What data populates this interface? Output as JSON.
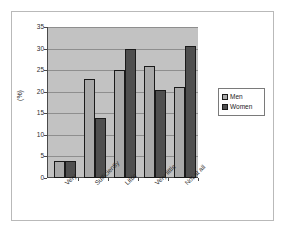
{
  "chart_data": {
    "type": "bar",
    "title": "",
    "subtitle": "",
    "xlabel": "",
    "ylabel": "(%)",
    "categories": [
      "Very",
      "Sufficiently",
      "Little",
      "Very little",
      "Not at all"
    ],
    "series": [
      {
        "name": "Men",
        "color": "#a9a9a9",
        "values": [
          4,
          23,
          25,
          26,
          21
        ]
      },
      {
        "name": "Women",
        "color": "#4f4f4f",
        "values": [
          4,
          14,
          30,
          20.5,
          30.5
        ]
      }
    ],
    "ylim": [
      0,
      35
    ],
    "ytick_values": [
      0,
      5,
      10,
      15,
      20,
      25,
      30,
      35
    ],
    "ytick_labels": [
      "0",
      "5",
      "10",
      "15",
      "20",
      "25",
      "30",
      "35"
    ],
    "grid": true,
    "grid_axis": "y",
    "legend_position": "right",
    "plot_background": "#c2c2c2",
    "figure_background": "#ffffff"
  },
  "legend": {
    "entries": [
      {
        "label": "Men"
      },
      {
        "label": "Women"
      }
    ]
  }
}
